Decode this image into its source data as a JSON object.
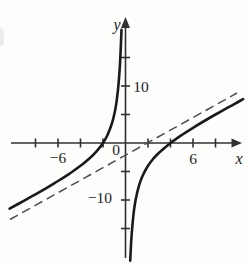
{
  "figure": {
    "background": "#fdfdfc",
    "colors": {
      "axis": "#303030",
      "curve": "#1a1a1a",
      "asymptote": "#4d4d4d",
      "text": "#1f1f1f"
    },
    "labels": {
      "y_axis": "y",
      "x_axis": "x",
      "origin": "0",
      "x_neg6": "−6",
      "x_pos6": "6",
      "y_pos10": "10",
      "y_neg10": "−10"
    }
  },
  "chart_data": {
    "type": "line",
    "xlabel": "x",
    "ylabel": "y",
    "xlim": [
      -10.6,
      10.6
    ],
    "ylim": [
      -21.5,
      22
    ],
    "x_ticks": [
      -8,
      -6,
      -4,
      -2,
      2,
      4,
      6,
      8
    ],
    "x_tick_step": 2,
    "y_ticks": [
      -15,
      -10,
      -5,
      5,
      10,
      15
    ],
    "y_tick_step": 5,
    "labeled_ticks": {
      "x": [
        -6,
        6
      ],
      "y": [
        10,
        -10
      ]
    },
    "grid": false,
    "legend": false,
    "x_intercepts": [
      -2,
      4
    ],
    "asymptotes": {
      "vertical": "x = 0",
      "slant": "y = x − 2"
    },
    "series": [
      {
        "name": "curve",
        "style": "solid",
        "equation": "y = x − 2 − 8/x",
        "branches": [
          {
            "name": "left",
            "points": [
              [
                -10.3,
                -11.52
              ],
              [
                -9,
                -10.11
              ],
              [
                -8,
                -9.0
              ],
              [
                -7,
                -7.86
              ],
              [
                -6,
                -6.67
              ],
              [
                -5,
                -5.4
              ],
              [
                -4,
                -4.0
              ],
              [
                -3,
                -2.33
              ],
              [
                -2.5,
                -1.3
              ],
              [
                -2,
                0
              ],
              [
                -1.6,
                1.4
              ],
              [
                -1.2,
                3.47
              ],
              [
                -0.9,
                5.99
              ],
              [
                -0.7,
                8.73
              ],
              [
                -0.55,
                12.0
              ],
              [
                -0.45,
                15.33
              ],
              [
                -0.36,
                19.86
              ]
            ]
          },
          {
            "name": "right",
            "points": [
              [
                0.42,
                -20.63
              ],
              [
                0.5,
                -17.5
              ],
              [
                0.6,
                -14.73
              ],
              [
                0.75,
                -11.92
              ],
              [
                0.95,
                -9.47
              ],
              [
                1.2,
                -7.47
              ],
              [
                1.5,
                -5.83
              ],
              [
                2,
                -4.0
              ],
              [
                2.5,
                -2.7
              ],
              [
                3,
                -1.67
              ],
              [
                4,
                0
              ],
              [
                5,
                1.4
              ],
              [
                6,
                2.67
              ],
              [
                7,
                3.86
              ],
              [
                8,
                5.0
              ],
              [
                9,
                6.11
              ],
              [
                10,
                7.2
              ],
              [
                10.45,
                7.68
              ]
            ]
          }
        ]
      },
      {
        "name": "slant-asymptote",
        "style": "dashed",
        "equation": "y = x − 2",
        "points": [
          [
            -10.27,
            -13.42
          ],
          [
            9.91,
            8.77
          ]
        ]
      }
    ]
  }
}
